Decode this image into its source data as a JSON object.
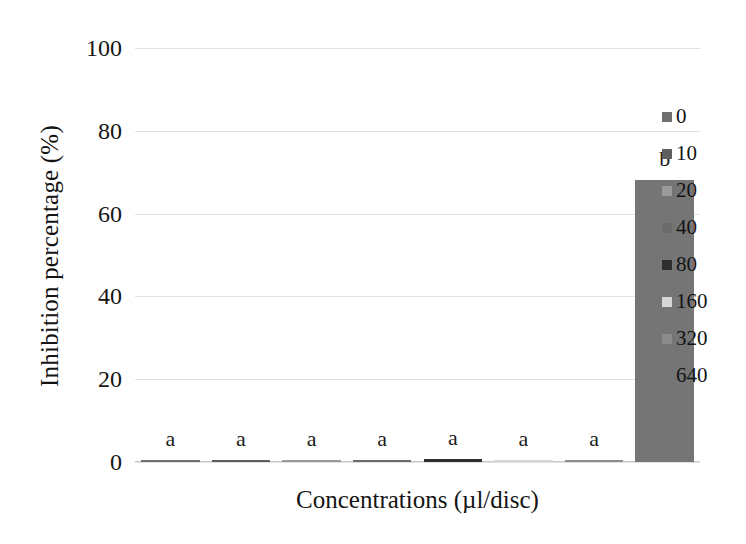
{
  "chart_data": {
    "type": "bar",
    "title": "",
    "xlabel": "Concentrations (µl/disc)",
    "ylabel": "Inhibition percentage (%)",
    "categories": [
      "0",
      "10",
      "20",
      "40",
      "80",
      "160",
      "320",
      "640"
    ],
    "values": [
      0.4,
      0.4,
      0.4,
      0.4,
      0.8,
      0.3,
      0.4,
      68
    ],
    "annotations": [
      "a",
      "a",
      "a",
      "a",
      "a",
      "a",
      "a",
      "b"
    ],
    "ylim": [
      0,
      100
    ],
    "yticks": [
      0,
      20,
      40,
      60,
      80,
      100
    ],
    "ytick_labels": [
      "0",
      "20",
      "40",
      "60",
      "80",
      "100"
    ],
    "xtick_labels": [],
    "grid": true,
    "legend_position": "right",
    "series": [
      {
        "name": "Inhibition percentage",
        "values": [
          0.4,
          0.4,
          0.4,
          0.4,
          0.8,
          0.3,
          0.4,
          68
        ]
      }
    ],
    "bar_colors": [
      "#6f6f6f",
      "#5e5e5e",
      "#9a9a9a",
      "#6b6b6b",
      "#2e2e2e",
      "#d6d6d6",
      "#8c8c8c",
      "#757575"
    ]
  },
  "legend": {
    "items": [
      {
        "label": "0",
        "color": "#6f6f6f"
      },
      {
        "label": "10",
        "color": "#5e5e5e"
      },
      {
        "label": "20",
        "color": "#9a9a9a"
      },
      {
        "label": "40",
        "color": "#6b6b6b"
      },
      {
        "label": "80",
        "color": "#2e2e2e"
      },
      {
        "label": "160",
        "color": "#d6d6d6"
      },
      {
        "label": "320",
        "color": "#8c8c8c"
      },
      {
        "label": "640",
        "color": "#757575"
      }
    ]
  },
  "axes": {
    "y_title": "Inhibition percentage (%)",
    "x_title": "Concentrations (µl/disc)",
    "y_ticks": [
      "100",
      "80",
      "60",
      "40",
      "20",
      "0"
    ]
  },
  "colors": {
    "gridline": "#dcdcdc",
    "text": "#141414",
    "background": "#ffffff"
  }
}
